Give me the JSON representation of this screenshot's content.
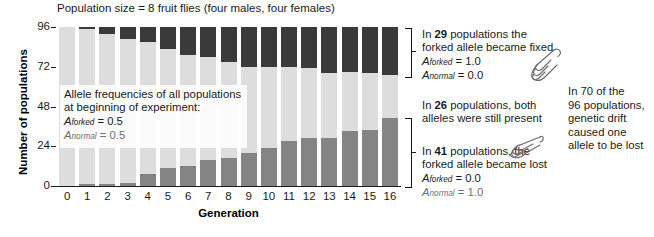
{
  "chart_data": {
    "type": "bar",
    "subtype": "stacked",
    "title": "Population size = 8 fruit flies (four males, four females)",
    "xlabel": "Generation",
    "ylabel": "Number of populations",
    "ylim": [
      0,
      96
    ],
    "yticks": [
      0,
      24,
      48,
      72,
      96
    ],
    "grid": false,
    "legend_position": "inside-plot",
    "categories": [
      "0",
      "1",
      "2",
      "3",
      "4",
      "5",
      "6",
      "7",
      "8",
      "9",
      "10",
      "11",
      "12",
      "13",
      "14",
      "15",
      "16"
    ],
    "series": [
      {
        "name": "forked allele became lost",
        "color": "#848484",
        "values": [
          0,
          1,
          1,
          2,
          7,
          11,
          12,
          16,
          17,
          20,
          23,
          27,
          29,
          29,
          33,
          34,
          41
        ]
      },
      {
        "name": "both alleles still present",
        "color": "#dddddd",
        "values": [
          96,
          94,
          91,
          87,
          80,
          72,
          67,
          62,
          58,
          52,
          49,
          45,
          42,
          39,
          36,
          34,
          26
        ]
      },
      {
        "name": "forked allele became fixed",
        "color": "#3a3a3a",
        "values": [
          0,
          1,
          4,
          7,
          9,
          13,
          17,
          18,
          21,
          24,
          24,
          24,
          25,
          28,
          27,
          28,
          29
        ]
      }
    ],
    "total_populations": 96
  },
  "title": "Population size = 8 fruit flies (four males, four females)",
  "axes": {
    "ylabel": "Number of populations",
    "xlabel": "Generation",
    "yticks": [
      "0",
      "24",
      "48",
      "72",
      "96"
    ],
    "xticks": [
      "0",
      "1",
      "2",
      "3",
      "4",
      "5",
      "6",
      "7",
      "8",
      "9",
      "10",
      "11",
      "12",
      "13",
      "14",
      "15",
      "16"
    ]
  },
  "legend_box": {
    "line1": "Allele frequencies of all populations",
    "line2": "at beginning of experiment:",
    "allele_forked_symbol": "A",
    "allele_forked_sub": "forked",
    "allele_forked_value": "= 0.5",
    "allele_normal_symbol": "A",
    "allele_normal_sub": "normal",
    "allele_normal_value": "= 0.5"
  },
  "annotations": {
    "fixed": {
      "count": "29",
      "prefix": "In",
      "line1_rest": "populations the",
      "line2": "forked allele became fixed",
      "allele_forked_symbol": "A",
      "allele_forked_sub": "forked",
      "allele_forked_value": "= 1.0",
      "allele_normal_symbol": "A",
      "allele_normal_sub": "normal",
      "allele_normal_value": "= 0.0"
    },
    "both": {
      "count": "26",
      "prefix": "In",
      "line1_rest": "populations, both",
      "line2": "alleles were still present"
    },
    "lost": {
      "count": "41",
      "prefix": "In",
      "line1_rest": "populations, the",
      "line2": "forked allele became lost",
      "allele_forked_symbol": "A",
      "allele_forked_sub": "forked",
      "allele_forked_value": "= 0.0",
      "allele_normal_symbol": "A",
      "allele_normal_sub": "normal",
      "allele_normal_value": "= 1.0"
    },
    "summary": {
      "line1": "In 70 of the",
      "line2": "96 populations,",
      "line3": "genetic drift",
      "line4": "caused one",
      "line5": "allele to be lost"
    }
  },
  "icons": {
    "hand_top": "pointing-hand-icon",
    "hand_bottom": "pointing-hand-icon"
  },
  "colors": {
    "fixed": "#3a3a3a",
    "both": "#dddddd",
    "lost": "#848484",
    "text": "#1a1a1a"
  }
}
